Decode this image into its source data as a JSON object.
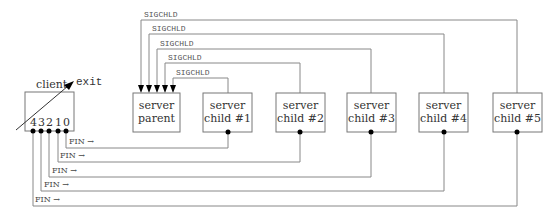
{
  "diagram": {
    "client": {
      "label": "client",
      "exit_label": "exit",
      "sockets": [
        "4",
        "3",
        "2",
        "1",
        "0"
      ]
    },
    "server_parent": {
      "line1": "server",
      "line2": "parent"
    },
    "children": [
      {
        "line1": "server",
        "line2": "child #1"
      },
      {
        "line1": "server",
        "line2": "child #2"
      },
      {
        "line1": "server",
        "line2": "child #3"
      },
      {
        "line1": "server",
        "line2": "child #4"
      },
      {
        "line1": "server",
        "line2": "child #5"
      }
    ],
    "signals": [
      "SIGCHLD",
      "SIGCHLD",
      "SIGCHLD",
      "SIGCHLD",
      "SIGCHLD"
    ],
    "fin_labels": [
      "FIN →",
      "FIN →",
      "FIN →",
      "FIN →",
      "FIN →"
    ]
  }
}
